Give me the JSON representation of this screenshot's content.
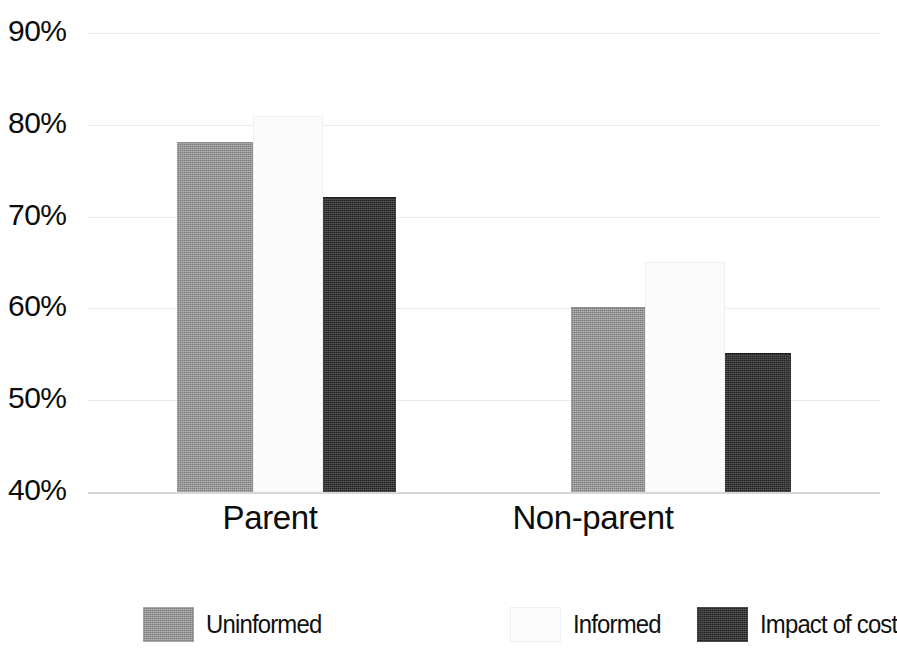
{
  "chart_data": {
    "type": "bar",
    "title": "",
    "subtitle": "",
    "xlabel": "",
    "ylabel": "",
    "categories": [
      "Parent",
      "Non-parent"
    ],
    "series": [
      {
        "name": "Uninformed",
        "color": "#9a9a9a",
        "values": [
          78,
          60
        ]
      },
      {
        "name": "Informed",
        "color": "#fbfbfb",
        "values": [
          81,
          65
        ]
      },
      {
        "name": "Impact of cost",
        "color": "#323232",
        "values": [
          72,
          55
        ]
      }
    ],
    "ylim": [
      40,
      90
    ],
    "ytick_values": [
      40,
      50,
      60,
      70,
      80,
      90
    ],
    "ytick_labels": [
      "40%",
      "50%",
      "60%",
      "70%",
      "80%",
      "90%"
    ],
    "value_format": "percent",
    "grid": true,
    "grid_axis": "y",
    "legend_position": "bottom",
    "legend_orientation": "horizontal"
  },
  "axis": {
    "y_ticks": [
      {
        "label": "90%",
        "value": 90
      },
      {
        "label": "80%",
        "value": 80
      },
      {
        "label": "70%",
        "value": 70
      },
      {
        "label": "60%",
        "value": 60
      },
      {
        "label": "50%",
        "value": 50
      },
      {
        "label": "40%",
        "value": 40
      }
    ]
  },
  "groups": [
    {
      "label": "Parent",
      "bars": [
        {
          "series": "Uninformed",
          "value": 78
        },
        {
          "series": "Informed",
          "value": 81
        },
        {
          "series": "Impact of cost",
          "value": 72
        }
      ]
    },
    {
      "label": "Non-parent",
      "bars": [
        {
          "series": "Uninformed",
          "value": 60
        },
        {
          "series": "Informed",
          "value": 65
        },
        {
          "series": "Impact of cost",
          "value": 55
        }
      ]
    }
  ],
  "legend": {
    "items": [
      {
        "label": "Uninformed",
        "swatch": "uninformed"
      },
      {
        "label": "Informed",
        "swatch": "informed"
      },
      {
        "label": "Impact of cost",
        "swatch": "impact"
      }
    ]
  },
  "caption_partial": "",
  "colors": {
    "uninformed": "#9a9a9a",
    "informed": "#fbfbfb",
    "impact_of_cost": "#323232",
    "gridline": "#eceaea",
    "text": "#0c0c0c"
  }
}
